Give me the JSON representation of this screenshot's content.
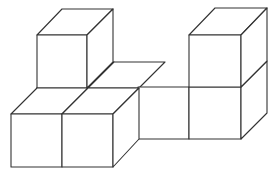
{
  "diagram": {
    "type": "isometric-cube-arrangement",
    "cube_count": 7,
    "colors": {
      "stroke": "#333333",
      "fill": "#ffffff",
      "background": "#ffffff"
    },
    "projection": {
      "edge_px": 51,
      "depth_dx": 26,
      "depth_dy": -26
    },
    "cubes": [
      {
        "id": "cube-back-top-left",
        "layer": "top",
        "x": 37,
        "y": 35
      },
      {
        "id": "cube-back-middle",
        "layer": "bottom",
        "x": 138,
        "y": 87
      },
      {
        "id": "cube-back-right-lower",
        "layer": "bottom",
        "x": 189,
        "y": 87
      },
      {
        "id": "cube-back-right-upper",
        "layer": "top",
        "x": 189,
        "y": 35
      },
      {
        "id": "cube-back-left-lower",
        "layer": "bottom",
        "x": 37,
        "y": 88
      },
      {
        "id": "cube-front-left",
        "layer": "bottom",
        "x": 11,
        "y": 114
      },
      {
        "id": "cube-front-right",
        "layer": "bottom",
        "x": 62,
        "y": 114
      }
    ]
  }
}
